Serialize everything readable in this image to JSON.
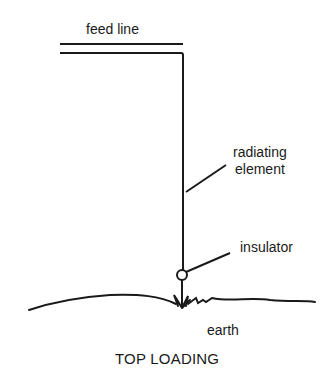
{
  "diagram": {
    "title": "TOP LOADING",
    "labels": {
      "feed_line": "feed line",
      "radiating_element": "radiating\nelement",
      "radiating_line1": "radiating",
      "radiating_line2": "element",
      "insulator": "insulator",
      "earth": "earth"
    },
    "stroke_color": "#1a1a1a",
    "background_color": "#ffffff"
  }
}
